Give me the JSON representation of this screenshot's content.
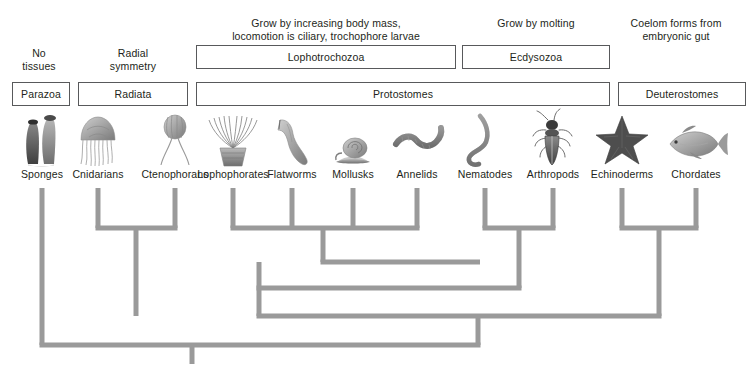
{
  "diagram": {
    "stroke_color": "#9a9a9a",
    "box_border_color": "#58595b",
    "text_color": "#231f20"
  },
  "annotations": [
    {
      "name": "no-tissues",
      "text": "No\ntissues",
      "line1": "No",
      "line2": "tissues",
      "x": 8,
      "y": 47,
      "width": 62
    },
    {
      "name": "radial-symmetry",
      "text": "Radial\nsymmetry",
      "line1": "Radial",
      "line2": "symmetry",
      "x": 78,
      "y": 47,
      "width": 110
    },
    {
      "name": "lophotrochozoa-traits",
      "text": "Grow by increasing body mass,\nlocomotion is ciliary, trochophore larvae",
      "line1": "Grow by increasing body mass,",
      "line2": "locomotion is ciliary, trochophore larvae",
      "x": 196,
      "y": 17,
      "width": 260
    },
    {
      "name": "ecdysozoa-traits",
      "text": "Grow by molting",
      "line1": "Grow by molting",
      "line2": "",
      "x": 462,
      "y": 17,
      "width": 148
    },
    {
      "name": "deuterostome-traits",
      "text": "Coelom forms from\nembryonic gut",
      "line1": "Coelom forms from",
      "line2": "embryonic gut",
      "x": 606,
      "y": 17,
      "width": 140
    }
  ],
  "upper_boxes": [
    {
      "name": "box-lophotrochozoa",
      "label": "Lophotrochozoa",
      "x": 196,
      "y": 45,
      "width": 260,
      "height": 24
    },
    {
      "name": "box-ecdysozoa",
      "label": "Ecdysozoa",
      "x": 462,
      "y": 45,
      "width": 148,
      "height": 24
    }
  ],
  "lower_boxes": [
    {
      "name": "box-parazoa",
      "label": "Parazoa",
      "x": 12,
      "y": 82,
      "width": 58,
      "height": 24
    },
    {
      "name": "box-radiata",
      "label": "Radiata",
      "x": 78,
      "y": 82,
      "width": 110,
      "height": 24
    },
    {
      "name": "box-protostomes",
      "label": "Protostomes",
      "x": 196,
      "y": 82,
      "width": 414,
      "height": 24
    },
    {
      "name": "box-deuterostomes",
      "label": "Deuterostomes",
      "x": 618,
      "y": 82,
      "width": 128,
      "height": 24
    }
  ],
  "taxa": [
    {
      "name": "sponges",
      "label": "Sponges",
      "x": 42,
      "icon": "sponge-icon"
    },
    {
      "name": "cnidarians",
      "label": "Cnidarians",
      "x": 98,
      "icon": "jellyfish-icon"
    },
    {
      "name": "ctenophorans",
      "label": "Ctenophorans",
      "x": 175,
      "icon": "comb-jelly-icon"
    },
    {
      "name": "lophophorates",
      "label": "Lophophorates",
      "x": 233,
      "icon": "lophophore-icon"
    },
    {
      "name": "flatworms",
      "label": "Flatworms",
      "x": 292,
      "icon": "flatworm-icon"
    },
    {
      "name": "mollusks",
      "label": "Mollusks",
      "x": 353,
      "icon": "snail-icon"
    },
    {
      "name": "annelids",
      "label": "Annelids",
      "x": 417,
      "icon": "earthworm-icon"
    },
    {
      "name": "nematodes",
      "label": "Nematodes",
      "x": 485,
      "icon": "roundworm-icon"
    },
    {
      "name": "arthropods",
      "label": "Arthropods",
      "x": 553,
      "icon": "beetle-icon"
    },
    {
      "name": "echinoderms",
      "label": "Echinoderms",
      "x": 622,
      "icon": "sea-star-icon"
    },
    {
      "name": "chordates",
      "label": "Chordates",
      "x": 696,
      "icon": "fish-icon"
    }
  ],
  "taxa_label_y": 168,
  "cladogram": {
    "tip_y": 188,
    "root_x": 192,
    "root_bottom_y": 364,
    "nodes": [
      {
        "name": "radiata-node",
        "y": 228,
        "x_from": 98,
        "x_to": 175,
        "stem_x": 136,
        "stem_to_y": 316
      },
      {
        "name": "lophotrochozoa-node",
        "y": 228,
        "x_from": 233,
        "x_to": 417,
        "stem_x": 323,
        "stem_to_y": 262
      },
      {
        "name": "annelid-mollusk-node",
        "y": 262,
        "x_from": 323,
        "x_to": 417,
        "stem_x": 417,
        "stem_to_y": 262
      },
      {
        "name": "ecdysozoa-node",
        "y": 228,
        "x_from": 485,
        "x_to": 553,
        "stem_x": 519,
        "stem_to_y": 288
      },
      {
        "name": "deuterostome-node",
        "y": 228,
        "x_from": 622,
        "x_to": 696,
        "stem_x": 659,
        "stem_to_y": 288
      },
      {
        "name": "protostome-node",
        "y": 288,
        "x_from": 259,
        "x_to": 519,
        "stem_x": 259,
        "stem_to_y": 316
      },
      {
        "name": "bilateria-node",
        "y": 316,
        "x_from": 259,
        "x_to": 659,
        "stem_x": 478,
        "stem_to_y": 345
      },
      {
        "name": "eumetazoa-node",
        "y": 345,
        "x_from": 42,
        "x_to": 478,
        "stem_x": 192,
        "stem_to_y": 364
      }
    ]
  }
}
